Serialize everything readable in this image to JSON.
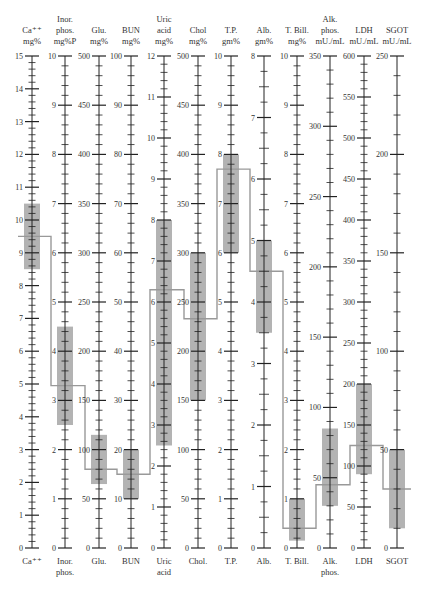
{
  "chart_data": {
    "type": "line",
    "title": "",
    "colors": {
      "normal_range": "#b3b3b3",
      "profile_line": "#999999",
      "axis": "#222222",
      "background": "#ffffff"
    },
    "layout": {
      "axis_top_y": 56,
      "axis_bottom_y": 548,
      "grid": false,
      "legend": "none"
    },
    "axes": [
      {
        "id": "ca",
        "header": [
          "Ca⁺⁺",
          "mg%"
        ],
        "footer": [
          "Ca⁺⁺"
        ],
        "min": 0,
        "max": 15,
        "major": 1,
        "minor": 0.2,
        "labels": [
          0,
          1,
          2,
          3,
          4,
          5,
          6,
          7,
          8,
          9,
          10,
          11,
          12,
          13,
          14,
          15
        ],
        "x": 32,
        "normal": [
          8.5,
          10.5
        ],
        "value": 9.5
      },
      {
        "id": "phos",
        "header": [
          "Inor.",
          "phos.",
          "mg%P"
        ],
        "footer": [
          "Inor.",
          "phos."
        ],
        "min": 0,
        "max": 10,
        "major": 1,
        "minor": 0.2,
        "labels": [
          0,
          1,
          2,
          3,
          4,
          5,
          6,
          7,
          8,
          9,
          10
        ],
        "x": 65,
        "normal": [
          2.5,
          4.5
        ],
        "value": 3.3
      },
      {
        "id": "glu",
        "header": [
          "Glu.",
          "mg%"
        ],
        "footer": [
          "Glu."
        ],
        "min": 0,
        "max": 500,
        "major": 50,
        "minor": 10,
        "labels": [
          0,
          50,
          100,
          150,
          200,
          250,
          300,
          350,
          400,
          450,
          500
        ],
        "x": 99,
        "normal": [
          65,
          115
        ],
        "value": 80
      },
      {
        "id": "bun",
        "header": [
          "BUN",
          "mg%"
        ],
        "footer": [
          "BUN"
        ],
        "min": 0,
        "max": 100,
        "major": 10,
        "minor": 2,
        "labels": [
          0,
          10,
          20,
          30,
          40,
          50,
          60,
          70,
          80,
          90,
          100
        ],
        "x": 131,
        "normal": [
          10,
          20
        ],
        "value": 15
      },
      {
        "id": "uric",
        "header": [
          "Uric",
          "acid",
          "mg%"
        ],
        "footer": [
          "Uric",
          "acid"
        ],
        "min": 0,
        "max": 12,
        "major": 1,
        "minor": 0.2,
        "labels": [
          0,
          1,
          2,
          3,
          4,
          5,
          6,
          7,
          8,
          9,
          10,
          11,
          12
        ],
        "x": 164,
        "normal": [
          2.5,
          8.0
        ],
        "value": 6.3
      },
      {
        "id": "chol",
        "header": [
          "Chol",
          "mg%"
        ],
        "footer": [
          "Chol."
        ],
        "min": 0,
        "max": 500,
        "major": 50,
        "minor": 10,
        "labels": [
          0,
          50,
          100,
          150,
          200,
          250,
          300,
          350,
          400,
          450,
          500
        ],
        "x": 198,
        "normal": [
          150,
          300
        ],
        "value": 233
      },
      {
        "id": "tp",
        "header": [
          "T.P.",
          "gm%"
        ],
        "footer": [
          "T.P."
        ],
        "min": 0,
        "max": 10,
        "major": 1,
        "minor": 0.2,
        "labels": [
          0,
          1,
          2,
          3,
          4,
          5,
          6,
          7,
          8,
          9,
          10
        ],
        "x": 231,
        "normal": [
          6.0,
          8.0
        ],
        "value": 7.7
      },
      {
        "id": "alb",
        "header": [
          "Alb.",
          "gm%"
        ],
        "footer": [
          "Alb."
        ],
        "min": 0,
        "max": 8,
        "major": 1,
        "minor": 0.25,
        "labels": [
          0,
          1,
          2,
          3,
          4,
          5,
          6,
          7,
          8
        ],
        "x": 264,
        "normal": [
          3.5,
          5.0
        ],
        "value": 4.5
      },
      {
        "id": "tbil",
        "header": [
          "T. Bill.",
          "mg%"
        ],
        "footer": [
          "T. Bill."
        ],
        "min": 0,
        "max": 10,
        "major": 1,
        "minor": 0.2,
        "labels": [
          0,
          1,
          2,
          3,
          4,
          5,
          6,
          7,
          8,
          9,
          10
        ],
        "x": 297,
        "normal": [
          0.15,
          1.0
        ],
        "value": 0.4
      },
      {
        "id": "alk",
        "header": [
          "Alk.",
          "phos.",
          "mU./mL"
        ],
        "footer": [
          "Alk.",
          "phos."
        ],
        "min": 0,
        "max": 350,
        "major": 50,
        "minor": 10,
        "labels": [
          0,
          50,
          100,
          150,
          200,
          250,
          300,
          350
        ],
        "x": 330,
        "normal": [
          30,
          85
        ],
        "value": 45
      },
      {
        "id": "ldh",
        "header": [
          "LDH",
          "mU./mL"
        ],
        "footer": [
          "LDH"
        ],
        "min": 0,
        "max": 600,
        "major": 50,
        "minor": 10,
        "labels": [
          0,
          50,
          100,
          150,
          200,
          250,
          300,
          350,
          400,
          450,
          500,
          550,
          600
        ],
        "x": 364,
        "normal": [
          90,
          200
        ],
        "value": 125
      },
      {
        "id": "sgot",
        "header": [
          "SGOT",
          "mU./mL"
        ],
        "footer": [
          "SGOT"
        ],
        "min": 0,
        "max": 250,
        "major": 50,
        "minor": 10,
        "labels": [
          0,
          50,
          100,
          150,
          200,
          250
        ],
        "x": 397,
        "normal": [
          10,
          50
        ],
        "value": 30
      }
    ]
  }
}
